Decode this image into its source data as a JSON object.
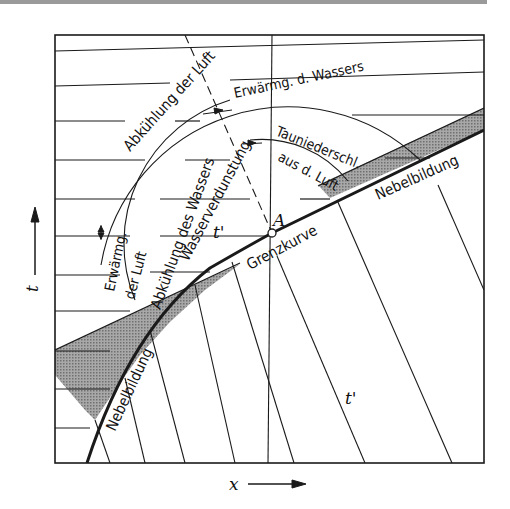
{
  "figure": {
    "axis_y_label": "t",
    "axis_x_label": "x",
    "point_label": "A",
    "region_label_upper": "t'",
    "region_label_lower": "t'",
    "curve_label": "Grenzkurve",
    "labels": {
      "abkuehlung_luft": "Abkühlung der Luft",
      "erwaermg_wasser": "Erwärmg. d. Wassers",
      "abkuehlung_wasser": "Abkühlung des Wassers",
      "wasserverdunstung": "Wasserverdunstung",
      "tauniederschl": "Tauniederschl.",
      "aus_d_luft": "aus d. Luft",
      "erwaermg": "Erwärmg.",
      "der_luft": "der Luft",
      "nebelbildung_right": "Nebelbildung",
      "nebelbildung_left": "Nebelbildung"
    },
    "colors": {
      "ink": "#1a1a1a",
      "shade": "#8a8a8a",
      "paper": "#ffffff",
      "top_rule": "#9a9a9a"
    }
  }
}
